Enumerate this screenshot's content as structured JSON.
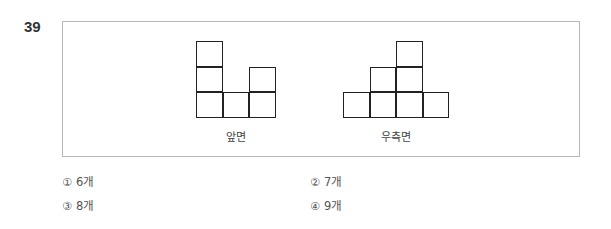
{
  "question": {
    "number": "39"
  },
  "figures": [
    {
      "name": "front-view",
      "label": "앞면",
      "column_heights": [
        3,
        1,
        2
      ]
    },
    {
      "name": "right-view",
      "label": "우측면",
      "column_heights": [
        1,
        2,
        3,
        1
      ]
    }
  ],
  "options": [
    {
      "mark": "①",
      "text": "6개"
    },
    {
      "mark": "②",
      "text": "7개"
    },
    {
      "mark": "③",
      "text": "8개"
    },
    {
      "mark": "④",
      "text": "9개"
    }
  ]
}
